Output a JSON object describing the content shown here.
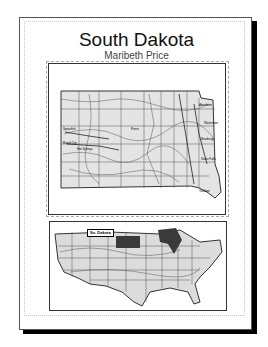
{
  "layout": {
    "title": "South Dakota",
    "author": "Maribeth Price"
  },
  "main_map": {
    "subject": "South Dakota counties, rivers and roads",
    "fill": "#e4e4e4",
    "line_color": "#333333"
  },
  "inset_map": {
    "subject": "Conterminous United States locator",
    "label": "So. Dakota",
    "highlight_state": "South Dakota",
    "highlight_color": "#3a3a3a",
    "fill": "#dcdcdc"
  }
}
